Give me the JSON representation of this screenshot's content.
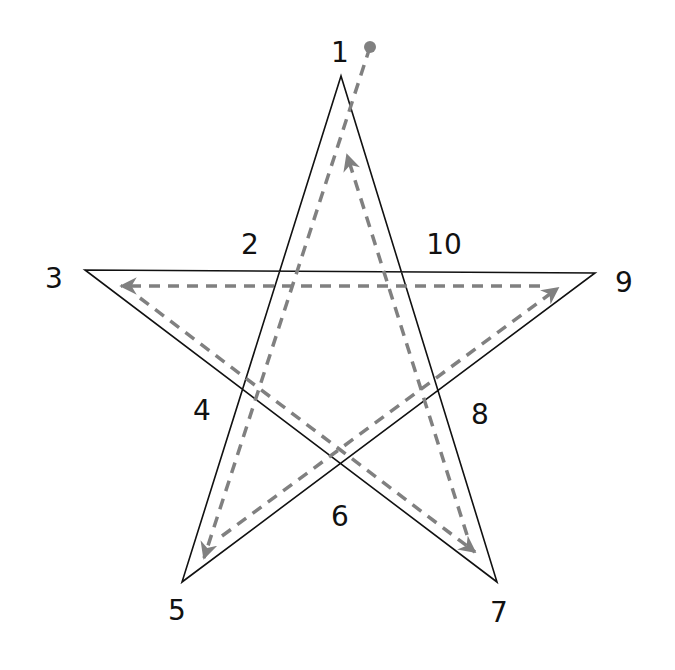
{
  "diagram": {
    "type": "pentagram-drawing-order",
    "star_color": "#111111",
    "path_color": "#808080",
    "star_vertices": {
      "top": [
        341,
        76
      ],
      "left": [
        85,
        270
      ],
      "right": [
        595,
        273
      ],
      "bottom_left": [
        182,
        582
      ],
      "bottom_right": [
        497,
        582
      ]
    },
    "start_dot": {
      "cx": 370,
      "cy": 47,
      "r": 6
    },
    "labels": [
      {
        "text": "1",
        "x": 340,
        "y": 62
      },
      {
        "text": "2",
        "x": 250,
        "y": 254
      },
      {
        "text": "3",
        "x": 54,
        "y": 288
      },
      {
        "text": "4",
        "x": 202,
        "y": 420
      },
      {
        "text": "5",
        "x": 177,
        "y": 620
      },
      {
        "text": "6",
        "x": 340,
        "y": 526
      },
      {
        "text": "7",
        "x": 499,
        "y": 622
      },
      {
        "text": "8",
        "x": 480,
        "y": 424
      },
      {
        "text": "9",
        "x": 624,
        "y": 292
      },
      {
        "text": "10",
        "x": 444,
        "y": 254
      }
    ],
    "path_segments": [
      {
        "from": [
          370,
          47
        ],
        "to": [
          204,
          558
        ]
      },
      {
        "from": [
          222,
          536
        ],
        "to": [
          558,
          288
        ]
      },
      {
        "from": [
          540,
          286
        ],
        "to": [
          121,
          286
        ]
      },
      {
        "from": [
          140,
          298
        ],
        "to": [
          475,
          552
        ]
      },
      {
        "from": [
          467,
          535
        ],
        "to": [
          347,
          155
        ]
      }
    ]
  }
}
